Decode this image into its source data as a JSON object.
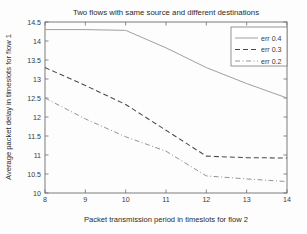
{
  "chart_data": {
    "type": "line",
    "title": "Two flows with same source and different destinations",
    "xlabel": "Packet transmission period in timeslots for flow 2",
    "ylabel": "Average packet delay in timeslots for flow 1",
    "xlim": [
      8,
      14
    ],
    "ylim": [
      10,
      14.5
    ],
    "xticks": [
      8,
      9,
      10,
      11,
      12,
      13,
      14
    ],
    "xticklabels": [
      "8",
      "9",
      "10",
      "11",
      "12",
      "13",
      "14"
    ],
    "yticks": [
      10,
      10.5,
      11,
      11.5,
      12,
      12.5,
      13,
      13.5,
      14,
      14.5
    ],
    "yticklabels": [
      "10",
      "10.5",
      "11",
      "11.5",
      "12",
      "12.5",
      "13",
      "13.5",
      "14",
      "14.5"
    ],
    "grid": false,
    "legend_position": "upper right",
    "x": [
      8,
      9,
      10,
      11,
      12,
      13,
      14
    ],
    "series": [
      {
        "name": "err 0.4",
        "style": "solid",
        "color": "#9a9a9a",
        "values": [
          14.3,
          14.3,
          14.28,
          13.82,
          13.3,
          12.88,
          12.5
        ]
      },
      {
        "name": "err 0.3",
        "style": "dashed",
        "color": "#4a4a4a",
        "values": [
          13.3,
          12.83,
          12.33,
          11.65,
          10.97,
          10.93,
          10.92
        ]
      },
      {
        "name": "err 0.2",
        "style": "dashdot",
        "color": "#8e8e8e",
        "values": [
          12.5,
          11.95,
          11.48,
          11.1,
          10.45,
          10.37,
          10.3
        ]
      }
    ]
  },
  "legend": {
    "entries": [
      {
        "label": "err 0.4"
      },
      {
        "label": "err 0.3"
      },
      {
        "label": "err 0.2"
      }
    ]
  }
}
